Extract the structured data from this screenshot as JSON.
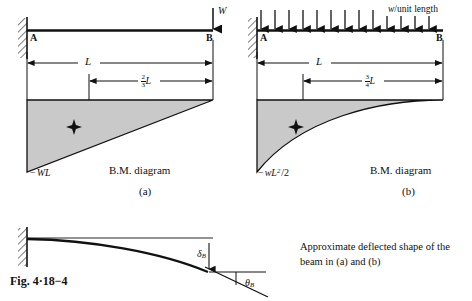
{
  "figure": {
    "number_label": "Fig. 4·18−4",
    "background_color": "#ffffff",
    "ink_color": "#111111",
    "diagram_fill_color": "#c9c9c9"
  },
  "panel_a": {
    "id": "(a)",
    "caption": "B.M. diagram",
    "support_label": "A",
    "free_end_label": "B",
    "load_label": "W",
    "load_type": "point-load",
    "span_label": "L",
    "centroid_numerator": "2",
    "centroid_denominator": "3",
    "centroid_unit": "L",
    "moment_label_sign": "−",
    "moment_label_body": "WL",
    "bm_shape": "triangle"
  },
  "panel_b": {
    "id": "(b)",
    "caption": "B.M. diagram",
    "support_label": "A",
    "free_end_label": "B",
    "load_label_italic": "w",
    "load_label_rest": "/unit length",
    "load_type": "uniformly-distributed-load",
    "udl_arrow_count": 13,
    "span_label": "L",
    "centroid_numerator": "3",
    "centroid_denominator": "4",
    "centroid_unit": "L",
    "moment_label_sign": "−",
    "moment_label_base": "wL",
    "moment_label_exponent": "2",
    "moment_label_divisor": "/2",
    "bm_shape": "parabola"
  },
  "panel_c": {
    "deflection_label": "δ",
    "deflection_subscript": "B",
    "rotation_label": "θ",
    "rotation_subscript": "B",
    "description_line_1": "Approximate deflected shape of the",
    "description_line_2": "beam in (a) and (b)"
  }
}
